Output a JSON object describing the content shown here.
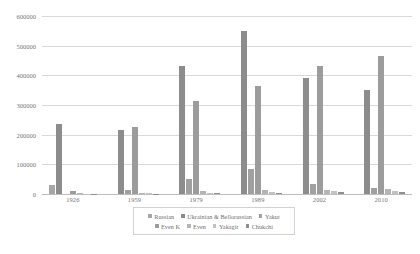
{
  "chart_data": {
    "type": "bar",
    "title": "",
    "subtitle": "",
    "xlabel": "",
    "ylabel": "",
    "categories": [
      "1926",
      "1959",
      "1979",
      "1989",
      "2002",
      "2010"
    ],
    "ylim": [
      0,
      600000
    ],
    "yticks": [
      0,
      100000,
      200000,
      300000,
      400000,
      500000,
      600000
    ],
    "ytick_labels": [
      "0",
      "100000",
      "200000",
      "300000",
      "400000",
      "500000",
      "600000"
    ],
    "grid": true,
    "legend_position": "bottom",
    "series": [
      {
        "name": "Russian",
        "color": "#a6a6a6",
        "values": [
          30000,
          0,
          0,
          0,
          0,
          0
        ]
      },
      {
        "name": "Ukrainian & Bellorussian",
        "color": "#8c8c8c",
        "values": [
          235000,
          215000,
          430000,
          550000,
          390000,
          350000
        ]
      },
      {
        "name": "Yakut",
        "color": "#a0a0a0",
        "values": [
          0,
          13000,
          50000,
          85000,
          35000,
          20000
        ]
      },
      {
        "name": "Even K",
        "color": "#9c9c9c",
        "values": [
          10000,
          225000,
          315000,
          365000,
          430000,
          465000
        ]
      },
      {
        "name": "Even",
        "color": "#b5b5b5",
        "values": [
          2000,
          4000,
          9000,
          12000,
          14000,
          16000
        ]
      },
      {
        "name": "Yakagir",
        "color": "#c2c2c2",
        "values": [
          1000,
          2500,
          5000,
          8000,
          9000,
          11000
        ]
      },
      {
        "name": "Chukchi",
        "color": "#8f8f8f",
        "values": [
          500,
          1500,
          3000,
          5000,
          5500,
          6000
        ]
      }
    ]
  }
}
